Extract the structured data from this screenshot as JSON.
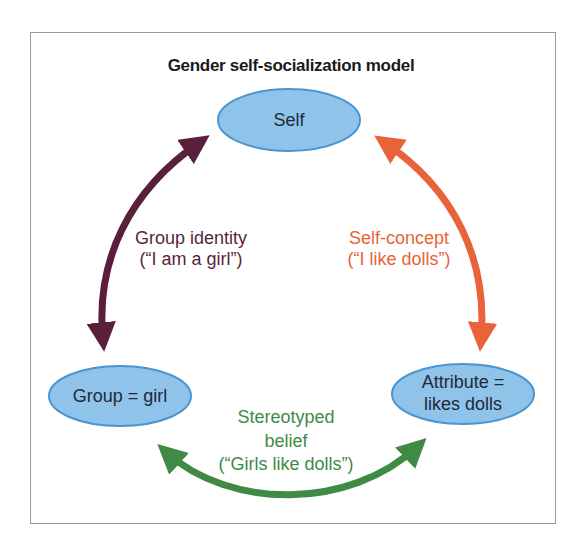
{
  "diagram": {
    "title": "Gender self-socialization model",
    "colors": {
      "node_fill": "#8fc3ea",
      "node_stroke": "#4a94d0",
      "node_text": "#1f2a36",
      "group_identity": "#5a1f3a",
      "self_concept": "#e8633a",
      "stereotyped_belief": "#3f8a45",
      "frame_border": "#9a9a9a"
    },
    "nodes": [
      {
        "id": "self",
        "lines": [
          "Self"
        ]
      },
      {
        "id": "group",
        "lines": [
          "Group = girl"
        ]
      },
      {
        "id": "attribute",
        "lines": [
          "Attribute =",
          "likes dolls"
        ]
      }
    ],
    "edges": [
      {
        "id": "group-identity",
        "from": "group",
        "to": "self",
        "bidirectional": true,
        "lines": [
          "Group identity",
          "(“I am a girl”)"
        ]
      },
      {
        "id": "self-concept",
        "from": "self",
        "to": "attribute",
        "bidirectional": true,
        "lines": [
          "Self-concept",
          "(“I like dolls”)"
        ]
      },
      {
        "id": "stereotyped-belief",
        "from": "group",
        "to": "attribute",
        "bidirectional": true,
        "lines": [
          "Stereotyped",
          "belief",
          "(“Girls like dolls”)"
        ]
      }
    ]
  }
}
